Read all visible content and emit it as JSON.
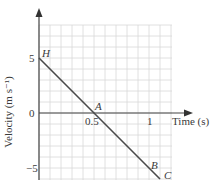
{
  "chart_data": {
    "type": "line",
    "title": "",
    "xlabel": "Time (s)",
    "ylabel": "Velocity (m s⁻¹)",
    "xlim": [
      0,
      1.2
    ],
    "ylim": [
      -6,
      7
    ],
    "x_ticks": [
      "0.5",
      "1"
    ],
    "y_ticks": [
      "5",
      "0",
      "−5"
    ],
    "grid": true,
    "series": [
      {
        "name": "velocity",
        "x": [
          0,
          0.5,
          1.05,
          1.1
        ],
        "values": [
          5,
          0,
          -5.5,
          -6
        ]
      }
    ],
    "annotations": [
      {
        "label": "H",
        "x": 0,
        "y": 5
      },
      {
        "label": "A",
        "x": 0.5,
        "y": 0
      },
      {
        "label": "B",
        "x": 1.05,
        "y": -5.5
      },
      {
        "label": "C",
        "x": 1.1,
        "y": -6
      }
    ],
    "colors": {
      "line": "#4a4a4a",
      "grid": "#d8d8d8",
      "axis": "#444444"
    }
  },
  "labels": {
    "y5": "5",
    "y0": "0",
    "yneg5": "−5",
    "x05": "0.5",
    "x1": "1",
    "xaxis": "Time (s)",
    "yaxis": "Velocity (m s⁻¹)",
    "H": "H",
    "A": "A",
    "B": "B",
    "C": "C"
  }
}
